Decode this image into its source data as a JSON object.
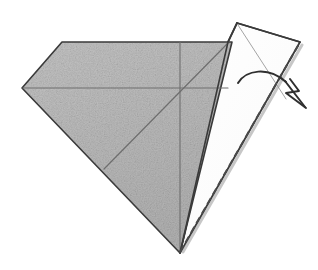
{
  "figure": {
    "kind": "origami-fold-step-diagram",
    "title": "Origami fold step: valley-fold right flap outward",
    "background_color": "#ffffff",
    "canvas": {
      "width": 318,
      "height": 270
    }
  },
  "palette": {
    "paper_shaded_fill": "#b9b9b9",
    "paper_shaded_fill_light": "#c6c6c6",
    "paper_white_fill": "#fefefe",
    "outline_stroke": "#3a3a3a",
    "crease_stroke": "#6e6e6e",
    "thin_crease_stroke": "#9a9a9a",
    "dashed_fold_stroke": "#4a4a4a",
    "arrow_stroke": "#2f2f2f",
    "shadow_stroke": "#808080"
  },
  "shapes": {
    "shaded_body": {
      "name": "shaded-paper-body",
      "description": "Large grey shaded kite shape forming the main body of the model",
      "points": "22,88 62,42 232,42 180,253",
      "fill": "#b9b9b9",
      "stroke": "#3a3a3a",
      "stroke_width": 1.6
    },
    "white_flap": {
      "name": "white-paper-flap",
      "description": "Raised white under-side flap on the right being folded",
      "points": "237,23 300,42 180,253 228,42",
      "fill": "#fefefe",
      "stroke": "#3a3a3a",
      "stroke_width": 1.8
    },
    "white_flap_outline": {
      "name": "white-flap-outline",
      "points": "237,23 300,42 180,253 228,42 237,23"
    }
  },
  "creases": [
    {
      "name": "horizontal-crease",
      "description": "Horizontal crease from left vertex across the shaded body",
      "x1": 23,
      "y1": 88,
      "x2": 228,
      "y2": 88,
      "stroke": "#6e6e6e",
      "width": 1.1
    },
    {
      "name": "vertical-crease",
      "description": "Vertical centre crease dropping from the top edge to the bottom apex",
      "x1": 180,
      "y1": 42,
      "x2": 180,
      "y2": 253,
      "stroke": "#6e6e6e",
      "width": 1.1
    },
    {
      "name": "diagonal-crease",
      "description": "Diagonal crease running from the lower-left edge to the top-right corner",
      "x1": 104,
      "y1": 169,
      "x2": 228,
      "y2": 43,
      "stroke": "#6e6e6e",
      "width": 1.2
    },
    {
      "name": "flap-inner-crease",
      "description": "Faint crease inside the white flap from its apex toward the lower right",
      "x1": 238,
      "y1": 25,
      "x2": 286,
      "y2": 99,
      "stroke": "#9a9a9a",
      "width": 0.9
    }
  ],
  "fold_line": {
    "name": "dashed-valley-fold-line",
    "description": "Dashed line marking the fold axis from the bottom apex to the upper right corner",
    "x1": 180,
    "y1": 252,
    "x2": 299,
    "y2": 44,
    "stroke": "#4a4a4a",
    "width": 2.0,
    "dash_pattern": "7 4"
  },
  "arrow": {
    "name": "fold-direction-arrow",
    "description": "Curved arrow showing the right flap swinging over to the right",
    "path": "M 238,83 C 246,70 268,66 286,82",
    "stroke": "#2f2f2f",
    "width": 2.0,
    "head": {
      "name": "arrowhead",
      "tip_x": 306,
      "tip_y": 108,
      "points": "306,108 286,93 299,91 290,79"
    }
  },
  "labels": {
    "step_caption": "",
    "notes": ""
  }
}
